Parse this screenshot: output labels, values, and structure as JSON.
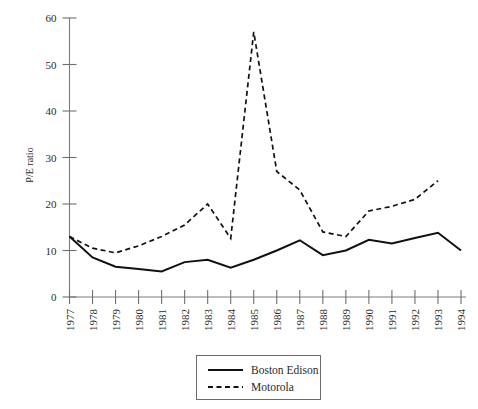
{
  "chart_data": {
    "type": "line",
    "title": "",
    "xlabel": "",
    "ylabel": "P/E ratio",
    "x": [
      1977,
      1978,
      1979,
      1980,
      1981,
      1982,
      1983,
      1984,
      1985,
      1986,
      1987,
      1988,
      1989,
      1990,
      1991,
      1992,
      1993,
      1994
    ],
    "xtick_labels": [
      "1977",
      "1978",
      "1979",
      "1980",
      "1981",
      "1982",
      "1983",
      "1984",
      "1985",
      "1986",
      "1987",
      "1988",
      "1989",
      "1990",
      "1991",
      "1992",
      "1993",
      "1994"
    ],
    "ytick_labels": [
      "0",
      "10",
      "20",
      "30",
      "40",
      "50",
      "60"
    ],
    "yticks": [
      0,
      10,
      20,
      30,
      40,
      50,
      60
    ],
    "ylim": [
      0,
      60
    ],
    "xlim": [
      1977,
      1994
    ],
    "grid": false,
    "legend_position": "bottom-center",
    "series": [
      {
        "name": "Boston Edison",
        "style": "solid",
        "color": "#111111",
        "values": [
          13.0,
          8.5,
          6.5,
          6.0,
          5.5,
          7.5,
          8.0,
          6.3,
          8.0,
          10.0,
          12.2,
          9.0,
          10.0,
          12.3,
          11.5,
          12.7,
          13.8,
          10.0
        ]
      },
      {
        "name": "Motorola",
        "style": "dashed",
        "color": "#111111",
        "values": [
          13.0,
          10.5,
          9.5,
          11.0,
          13.0,
          15.5,
          20.0,
          12.6,
          57.0,
          27.0,
          23.0,
          14.0,
          13.0,
          18.5,
          19.5,
          21.0,
          25.0,
          null
        ]
      }
    ],
    "annotations": []
  },
  "legend": {
    "entries": [
      {
        "label": "Boston Edison",
        "style": "solid"
      },
      {
        "label": "Motorola",
        "style": "dashed"
      }
    ]
  },
  "axis": {
    "y_title": "P/E ratio"
  }
}
